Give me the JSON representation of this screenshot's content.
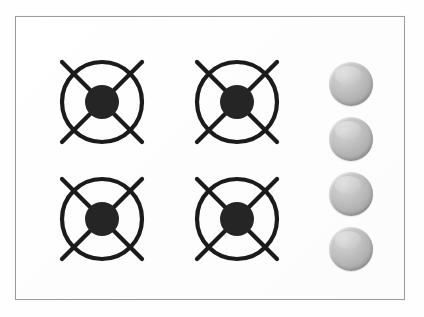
{
  "appliance": {
    "name": "gas-cooktop",
    "title": "Four burner gas cooktop",
    "panel": {
      "label": "Cooktop surface panel",
      "background_color": "#fdfdfd",
      "border_color": "#9c9c9c",
      "x": 15,
      "y": 16,
      "width": 390,
      "height": 284
    }
  },
  "burners": [
    {
      "id": "burner-rear-left",
      "label": "Rear left burner",
      "position": "rear-left",
      "x": 54,
      "y": 54,
      "size": 96,
      "ring_color": "#1b1b1b",
      "hub_color": "#252525",
      "ring_radius": 40,
      "hub_radius": 17,
      "arm_count": 4
    },
    {
      "id": "burner-rear-right",
      "label": "Rear right burner",
      "position": "rear-right",
      "x": 189,
      "y": 54,
      "size": 96,
      "ring_color": "#1b1b1b",
      "hub_color": "#252525",
      "ring_radius": 40,
      "hub_radius": 17,
      "arm_count": 4
    },
    {
      "id": "burner-front-left",
      "label": "Front left burner",
      "position": "front-left",
      "x": 54,
      "y": 171,
      "size": 96,
      "ring_color": "#1b1b1b",
      "hub_color": "#252525",
      "ring_radius": 40,
      "hub_radius": 17,
      "arm_count": 4
    },
    {
      "id": "burner-front-right",
      "label": "Front right burner",
      "position": "front-right",
      "x": 189,
      "y": 171,
      "size": 96,
      "ring_color": "#1b1b1b",
      "hub_color": "#252525",
      "ring_radius": 40,
      "hub_radius": 17,
      "arm_count": 4
    }
  ],
  "knobs": [
    {
      "id": "knob-1",
      "label": "Control knob 1",
      "controls": "burner-rear-left",
      "x": 329,
      "y": 62,
      "diameter": 44,
      "color_light": "#d6d6d6",
      "color_dark": "#959595"
    },
    {
      "id": "knob-2",
      "label": "Control knob 2",
      "controls": "burner-rear-right",
      "x": 329,
      "y": 117,
      "diameter": 44,
      "color_light": "#d6d6d6",
      "color_dark": "#959595"
    },
    {
      "id": "knob-3",
      "label": "Control knob 3",
      "controls": "burner-front-left",
      "x": 329,
      "y": 172,
      "diameter": 44,
      "color_light": "#d6d6d6",
      "color_dark": "#959595"
    },
    {
      "id": "knob-4",
      "label": "Control knob 4",
      "controls": "burner-front-right",
      "x": 329,
      "y": 227,
      "diameter": 44,
      "color_light": "#d6d6d6",
      "color_dark": "#959595"
    }
  ]
}
